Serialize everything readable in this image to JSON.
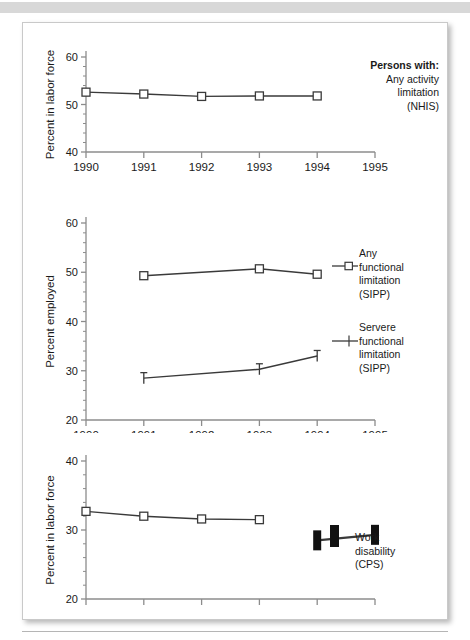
{
  "page": {
    "background_color": "#ffffff",
    "topbar_color": "#d8d8d8",
    "card_border_color": "#c9c9c9",
    "axis_color": "#8c8c8c",
    "line_color": "#3a3a3a",
    "text_color": "#1a1a1a"
  },
  "chart_data": [
    {
      "type": "line",
      "title": "",
      "xlabel": "",
      "ylabel": "Percent in labor force",
      "xlim": [
        1990,
        1995
      ],
      "ylim": [
        40,
        60
      ],
      "yticks": [
        40,
        50,
        60
      ],
      "ytick_labels": [
        "40",
        "50",
        "60"
      ],
      "xticks": [
        1990,
        1991,
        1992,
        1993,
        1994,
        1995
      ],
      "xtick_labels": [
        "1990",
        "1991",
        "1992",
        "1993",
        "1994",
        "1995"
      ],
      "grid": false,
      "legend_position": "right",
      "series": [
        {
          "name": "Any activity limitation (NHIS)",
          "marker": "open-square",
          "x": [
            1990,
            1991,
            1992,
            1993,
            1994
          ],
          "values": [
            52.6,
            52.2,
            51.7,
            51.8,
            51.8
          ]
        }
      ],
      "legend": {
        "heading": "Persons with:",
        "lines": [
          "Any activity",
          "limitation",
          "(NHIS)"
        ]
      }
    },
    {
      "type": "line",
      "title": "",
      "xlabel": "",
      "ylabel": "Percent employed",
      "xlim": [
        1990,
        1995
      ],
      "ylim": [
        20,
        60
      ],
      "yticks": [
        20,
        30,
        40,
        50,
        60
      ],
      "ytick_labels": [
        "20",
        "30",
        "40",
        "50",
        "60"
      ],
      "xticks": [
        1990,
        1991,
        1992,
        1993,
        1994,
        1995
      ],
      "xtick_labels": [
        "1990",
        "1991",
        "1992",
        "1993",
        "1994",
        "1995"
      ],
      "grid": false,
      "legend_position": "right",
      "series": [
        {
          "name": "Any functional limitation (SIPP)",
          "marker": "open-square",
          "x": [
            1991,
            1993,
            1994
          ],
          "values": [
            49.3,
            50.7,
            49.6
          ]
        },
        {
          "name": "Servere functional limitation (SIPP)",
          "marker": "cross",
          "x": [
            1991,
            1993,
            1994
          ],
          "values": [
            28.5,
            30.3,
            33.0
          ]
        }
      ],
      "legend": {
        "entries": [
          {
            "marker": "open-square",
            "lines": [
              "Any",
              "functional",
              "limitation",
              "(SIPP)"
            ]
          },
          {
            "marker": "cross",
            "lines": [
              "Servere",
              "functional",
              "limitation",
              "(SIPP)"
            ]
          }
        ]
      }
    },
    {
      "type": "line",
      "title": "",
      "xlabel": "",
      "ylabel": "Percent in labor force",
      "xlim": [
        1990,
        1995
      ],
      "ylim": [
        20,
        40
      ],
      "yticks": [
        20,
        30,
        40
      ],
      "ytick_labels": [
        "20",
        "30",
        "40"
      ],
      "xticks": [
        1990,
        1991,
        1992,
        1993,
        1994,
        1995
      ],
      "xtick_labels": [
        "",
        "",
        "",
        "",
        "",
        ""
      ],
      "grid": false,
      "legend_position": "right",
      "series": [
        {
          "name": "Work disability (CPS) open",
          "marker": "open-square",
          "x": [
            1990,
            1991,
            1992,
            1993
          ],
          "values": [
            32.7,
            32.0,
            31.6,
            31.5
          ]
        },
        {
          "name": "Work disability (CPS) filled",
          "marker": "filled-bar",
          "x": [
            1994,
            1995
          ],
          "values": [
            28.5,
            29.3
          ]
        }
      ],
      "legend": {
        "entries": [
          {
            "marker": "filled-bar",
            "lines": [
              "Work",
              "disability",
              "(CPS)"
            ]
          }
        ]
      }
    }
  ]
}
